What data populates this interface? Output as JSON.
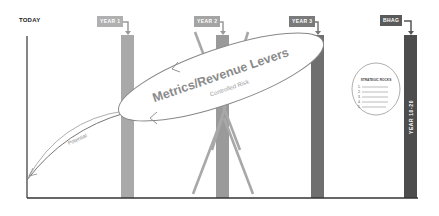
{
  "diagram": {
    "start_label": "TODAY",
    "milestones": [
      {
        "label": "YEAR 1",
        "color": "#a9a9a9",
        "label_color": "#b0b0b0"
      },
      {
        "label": "YEAR 2",
        "color": "#9a9a9a",
        "label_color": "#a4a4a4"
      },
      {
        "label": "YEAR 3",
        "color": "#6f6f6f",
        "label_color": "#7a7a7a"
      },
      {
        "label": "BHAG",
        "color": "#4d4d4d",
        "label_color": "#5a5a5a",
        "bar_text": "YEAR 10-20"
      }
    ],
    "ellipse": {
      "title": "Metrics/Revenue Levers",
      "subtitle": "Controlled Risk"
    },
    "potential_curve_label": "Potential",
    "strategic_rocks": {
      "title": "STRATEGIC ROCKS",
      "items": [
        "1.",
        "2.",
        "3.",
        "4.",
        "5."
      ]
    },
    "colors": {
      "axis": "#333333",
      "curve": "#888888",
      "ellipse_stroke": "#777777"
    }
  }
}
